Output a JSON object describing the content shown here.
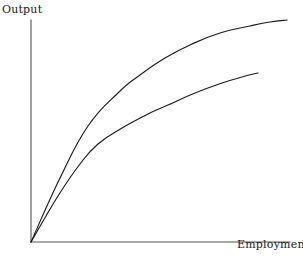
{
  "figure": {
    "name": "output-employment-diagram",
    "background_color": "#ffffff",
    "line_color": "#1a1a1a",
    "axis_color": "#555555"
  },
  "axes": {
    "y_label": "Output",
    "x_label": "Employment",
    "origin": [
      31,
      242
    ],
    "y_axis_top": [
      31,
      20
    ],
    "x_axis_right": [
      290,
      242
    ],
    "show_ticks": false,
    "show_grid": false
  },
  "chart_data": {
    "type": "line",
    "title": "",
    "xlabel": "Employment",
    "ylabel": "Output",
    "xlim": [
      0,
      1
    ],
    "ylim": [
      0,
      1
    ],
    "grid": false,
    "legend": "none",
    "series": [
      {
        "name": "upper-production-function",
        "points_px": [
          [
            31,
            242
          ],
          [
            60,
            178
          ],
          [
            88,
            126
          ],
          [
            118,
            93
          ],
          [
            140,
            75
          ],
          [
            165,
            58
          ],
          [
            192,
            44
          ],
          [
            220,
            33
          ],
          [
            250,
            26
          ],
          [
            270,
            22
          ],
          [
            287,
            20
          ]
        ],
        "x": [
          0.0,
          0.11,
          0.22,
          0.34,
          0.42,
          0.52,
          0.62,
          0.73,
          0.85,
          0.92,
          1.0
        ],
        "y": [
          0.0,
          0.29,
          0.52,
          0.67,
          0.75,
          0.83,
          0.89,
          0.94,
          0.97,
          0.99,
          1.0
        ]
      },
      {
        "name": "lower-production-function",
        "points_px": [
          [
            31,
            242
          ],
          [
            58,
            196
          ],
          [
            80,
            164
          ],
          [
            98,
            144
          ],
          [
            122,
            128
          ],
          [
            148,
            114
          ],
          [
            168,
            105
          ],
          [
            195,
            93
          ],
          [
            222,
            83
          ],
          [
            242,
            77
          ],
          [
            258,
            73
          ]
        ],
        "x": [
          0.0,
          0.1,
          0.19,
          0.26,
          0.35,
          0.45,
          0.53,
          0.63,
          0.74,
          0.81,
          0.88
        ],
        "y": [
          0.0,
          0.21,
          0.35,
          0.44,
          0.51,
          0.58,
          0.62,
          0.67,
          0.72,
          0.74,
          0.76
        ]
      }
    ]
  }
}
